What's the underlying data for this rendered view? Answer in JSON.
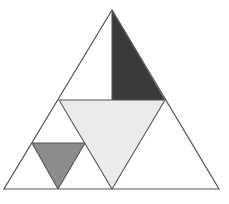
{
  "diagram": {
    "width": 229,
    "height": 204,
    "colors": {
      "background": "#ffffff",
      "stroke": "#555555",
      "dark_fill": "#3a3a3a",
      "medium_fill": "#8c8c8c",
      "light_fill": "#ebebeb",
      "white_fill": "#ffffff"
    },
    "outer_triangle": {
      "points": "112,10 4,189 219,189"
    },
    "regions": [
      {
        "name": "top-left-white-half",
        "points": "112,10 112,100 59,100",
        "fill": "white_fill"
      },
      {
        "name": "top-right-dark-half",
        "points": "112,10 165,100 112,100",
        "fill": "dark_fill"
      },
      {
        "name": "center-light-inverted-triangle",
        "points": "59,100 165,100 112,189",
        "fill": "light_fill"
      },
      {
        "name": "bottom-left-white-triangle",
        "points": "59,100 4,189 112,189",
        "fill": "white_fill"
      },
      {
        "name": "bottom-right-white-triangle",
        "points": "165,100 112,189 219,189",
        "fill": "white_fill"
      },
      {
        "name": "small-gray-inverted-triangle",
        "points": "32,143 85,143 58,189",
        "fill": "medium_fill"
      }
    ],
    "lines": [
      {
        "name": "vertical-divider",
        "x1": 112,
        "y1": 10,
        "x2": 112,
        "y2": 100
      },
      {
        "name": "mid-horizontal",
        "x1": 59,
        "y1": 100,
        "x2": 165,
        "y2": 100
      },
      {
        "name": "inner-left-diagonal",
        "x1": 59,
        "y1": 100,
        "x2": 112,
        "y2": 189
      },
      {
        "name": "inner-right-diagonal",
        "x1": 165,
        "y1": 100,
        "x2": 112,
        "y2": 189
      },
      {
        "name": "small-horizontal",
        "x1": 32,
        "y1": 143,
        "x2": 85,
        "y2": 143
      },
      {
        "name": "small-left-diagonal",
        "x1": 32,
        "y1": 143,
        "x2": 58,
        "y2": 189
      },
      {
        "name": "small-right-diagonal",
        "x1": 85,
        "y1": 143,
        "x2": 58,
        "y2": 189
      }
    ]
  }
}
